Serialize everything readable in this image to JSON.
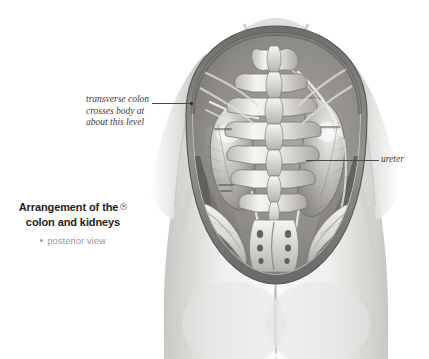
{
  "figure": {
    "caption": {
      "title_line_1": "Arrangement of the",
      "title_line_2": "colon and kidneys",
      "marker_icon": "rotate-view-icon",
      "subtitle": "posterior view"
    },
    "annotations": [
      {
        "id": "transverse-colon",
        "line_1": "transverse colon",
        "line_2": "crosses body at",
        "line_3": "about this level"
      },
      {
        "id": "ureter",
        "label": "ureter"
      }
    ],
    "illustration": {
      "name": "posterior-torso-kidneys-spine-engraving",
      "description": "Grayscale anatomical engraving, posterior view of the trunk with the back wall opened to reveal the lumbar spine, both kidneys, the lower ribs and the iliac crests.",
      "colors": {
        "background": "#ffffff",
        "ink_dark": "#3b3b3d",
        "ink_mid": "#8a8c8e",
        "ink_light": "#c9cbcc",
        "flesh_tint": "#e9e8e6"
      }
    }
  }
}
